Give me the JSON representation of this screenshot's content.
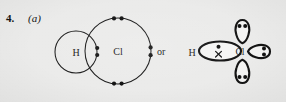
{
  "figure": {
    "item_number": "4.",
    "part_label": "(a)",
    "conjunction": "or",
    "caption_molecule": "HCl"
  },
  "lewis_diagram": {
    "name": "lewis-circle-diagram",
    "hydrogen": {
      "label": "H",
      "circle": {
        "cx": 76,
        "cy": 52,
        "r": 21
      }
    },
    "chlorine": {
      "label": "Cl",
      "circle": {
        "cx": 118,
        "cy": 51,
        "r": 33
      }
    },
    "electron_dots": [
      {
        "name": "shared-pair-dot-upper",
        "x": 97.2,
        "y": 48.0,
        "r": 2.1
      },
      {
        "name": "shared-pair-dot-lower",
        "x": 97.2,
        "y": 55.0,
        "r": 2.1
      },
      {
        "name": "lone-pair-top-left-dot",
        "x": 114.0,
        "y": 18.4,
        "r": 2.1
      },
      {
        "name": "lone-pair-top-right-dot",
        "x": 121.6,
        "y": 18.4,
        "r": 2.1
      },
      {
        "name": "lone-pair-bottom-left-dot",
        "x": 114.0,
        "y": 83.6,
        "r": 2.1
      },
      {
        "name": "lone-pair-bottom-right-dot",
        "x": 121.6,
        "y": 83.6,
        "r": 2.1
      },
      {
        "name": "lone-pair-right-upper-dot",
        "x": 150.6,
        "y": 47.4,
        "r": 2.1
      },
      {
        "name": "lone-pair-right-lower-dot",
        "x": 150.6,
        "y": 55.2,
        "r": 2.1
      }
    ]
  },
  "orbital_diagram": {
    "name": "orbital-overlap-diagram",
    "hydrogen": {
      "label": "H",
      "x": 192,
      "y": 55
    },
    "chlorine": {
      "label": "Cl",
      "x": 240,
      "y": 54.5
    },
    "bond_orbital": {
      "name": "sigma-bond-orbital",
      "cx": 220,
      "cy": 51,
      "rx": 21,
      "ry": 9.5,
      "electron_x_mark": {
        "x": 218.5,
        "y": 54.0
      },
      "electron_dot": {
        "x": 218.5,
        "y": 46.8,
        "r": 2.0
      }
    },
    "lone_pair_lobes": [
      {
        "name": "lone-pair-lobe-top",
        "orientation": "up",
        "dots": [
          {
            "x": 239.5,
            "y": 26.0,
            "r": 2.0
          },
          {
            "x": 245.2,
            "y": 26.0,
            "r": 2.0
          }
        ]
      },
      {
        "name": "lone-pair-lobe-bottom",
        "orientation": "down",
        "dots": [
          {
            "x": 239.5,
            "y": 77.0,
            "r": 2.0
          },
          {
            "x": 245.2,
            "y": 77.0,
            "r": 2.0
          }
        ]
      },
      {
        "name": "lone-pair-lobe-right",
        "orientation": "right",
        "dots": [
          {
            "x": 264.0,
            "y": 48.6,
            "r": 2.0
          },
          {
            "x": 264.0,
            "y": 54.4,
            "r": 2.0
          }
        ]
      }
    ]
  },
  "colors": {
    "background": "#ececeb",
    "ink": "#141414",
    "lobe_fill": "#f4f4f3"
  }
}
